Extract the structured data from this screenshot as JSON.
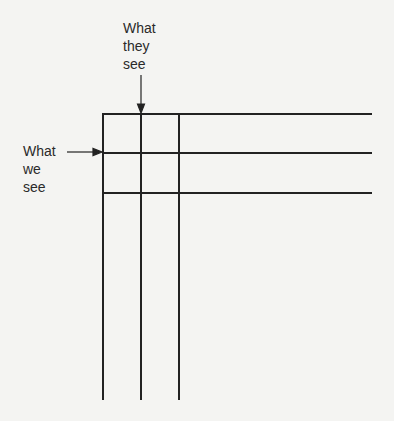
{
  "labels": {
    "they_see": "What\nthey\nsee",
    "we_see": "What\nwe\nsee"
  },
  "colors": {
    "background": "#f4f4f2",
    "line": "#222222",
    "text": "#2a2a2a"
  },
  "grid": {
    "vertical_lines_x": [
      103,
      141,
      179
    ],
    "horizontal_lines_y": [
      114,
      153,
      193
    ],
    "vertical_extent": [
      114,
      400
    ],
    "horizontal_extent": [
      103,
      372
    ]
  },
  "arrows": [
    {
      "name": "they-see-arrow",
      "from": [
        141,
        74
      ],
      "to": [
        141,
        114
      ],
      "direction": "down"
    },
    {
      "name": "we-see-arrow",
      "from": [
        67,
        152
      ],
      "to": [
        103,
        152
      ],
      "direction": "right"
    }
  ]
}
